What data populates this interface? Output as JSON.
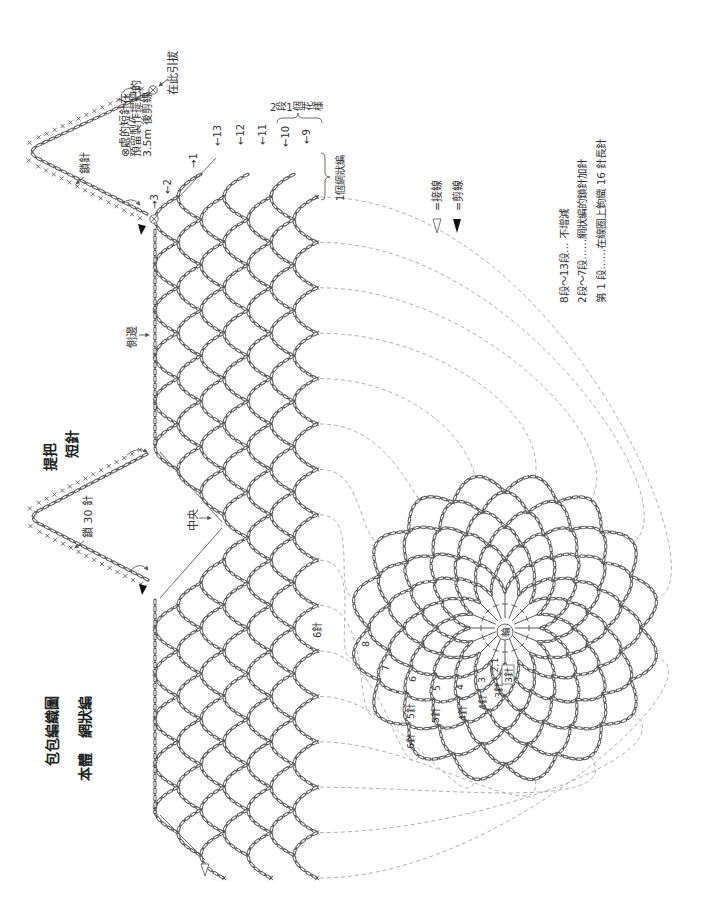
{
  "title": {
    "main": "包包編織圖",
    "body": "本體",
    "pattern": "網狀編"
  },
  "handle": {
    "title": "提把",
    "stitch": "短針",
    "chain_count": "鎖 30 針",
    "chain_pointer": "鎖針"
  },
  "annotations": {
    "cut_note": [
      "⊗處的短針在",
      "預留製作提把的",
      "3.5m 後剪線"
    ],
    "slip_stitch_here": "在此引拔",
    "center": "中央",
    "side": "側邊",
    "pattern_repeat": "2段1個花樣",
    "mesh_unit": "1個網狀編",
    "edge_stitch_count": "6針"
  },
  "rows": {
    "top": [
      "→3",
      "←2",
      "→1"
    ],
    "body": [
      "←13",
      "←12",
      "←11",
      "←10",
      "←9"
    ]
  },
  "base_circle": {
    "center": "輪",
    "round_labels": [
      "8",
      "7",
      "6",
      "5",
      "4",
      "3",
      "2,1"
    ],
    "stitch_labels": [
      "3針",
      "3針",
      "4針",
      "4針",
      "5針",
      "5針",
      "6針"
    ]
  },
  "legend": [
    {
      "symbol": "white-triangle",
      "label": "=接線"
    },
    {
      "symbol": "black-triangle",
      "label": "=剪線"
    }
  ],
  "notes": [
    "8段～13段… 不增減",
    "2段～7段……網狀編的鎖針加針",
    "第 1 段……在線圈上鉤織 16 針長針"
  ],
  "colors": {
    "line": "#5a5a5a",
    "guide": "#a8a8a8",
    "text": "#333333",
    "background": "#ffffff"
  }
}
